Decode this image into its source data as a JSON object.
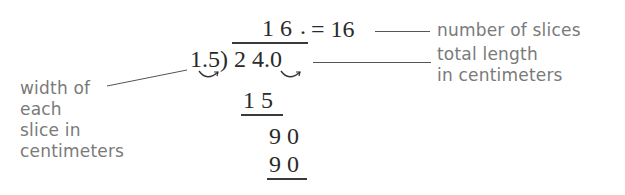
{
  "division": {
    "quotient": "1 6",
    "quotient_point": ".",
    "equals_result": "= 16",
    "divisor": "1.5)",
    "divisor_parts": [
      "1",
      ".",
      "5"
    ],
    "dividend": "2 4.0",
    "steps": [
      {
        "value": "1 5",
        "underlined": true
      },
      {
        "value": "9 0",
        "underlined": false
      },
      {
        "value": "9 0",
        "underlined": true
      }
    ],
    "computation": {
      "dividend": 24.0,
      "divisor": 1.5,
      "quotient": 16
    }
  },
  "annotations": {
    "quotient_label": "number of slices",
    "dividend_label_line1": "total length",
    "dividend_label_line2": "in centimeters",
    "divisor_label_lines": [
      "width of",
      "each",
      "slice in",
      "centimeters"
    ]
  },
  "colors": {
    "math_text": "#2a2a2a",
    "label_text": "#7a7a7a",
    "background": "#ffffff"
  }
}
